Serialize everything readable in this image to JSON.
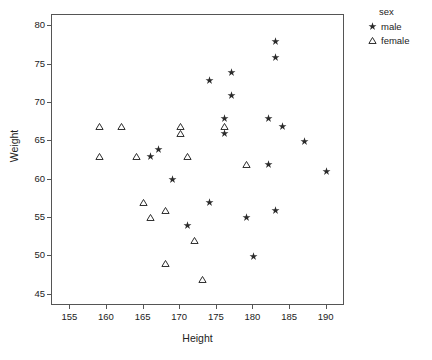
{
  "chart_data": {
    "type": "scatter",
    "title": "",
    "xlabel": "Height",
    "ylabel": "Weight",
    "xlim": [
      152.5,
      192.5
    ],
    "ylim": [
      43.5,
      81.5
    ],
    "xticks": [
      155,
      160,
      165,
      170,
      175,
      180,
      185,
      190
    ],
    "yticks": [
      45,
      50,
      55,
      60,
      65,
      70,
      75,
      80
    ],
    "grid": false,
    "legend": {
      "title": "sex",
      "position": "right-top",
      "entries": [
        {
          "label": "male",
          "marker": "star"
        },
        {
          "label": "female",
          "marker": "triangle"
        }
      ]
    },
    "series": [
      {
        "name": "male",
        "marker": "star",
        "color": "#2b2b2b",
        "points": [
          {
            "x": 166,
            "y": 63
          },
          {
            "x": 167,
            "y": 64
          },
          {
            "x": 169,
            "y": 60
          },
          {
            "x": 171,
            "y": 54
          },
          {
            "x": 174,
            "y": 73
          },
          {
            "x": 174,
            "y": 57
          },
          {
            "x": 176,
            "y": 68
          },
          {
            "x": 176,
            "y": 66
          },
          {
            "x": 177,
            "y": 74
          },
          {
            "x": 177,
            "y": 71
          },
          {
            "x": 179,
            "y": 55
          },
          {
            "x": 180,
            "y": 50
          },
          {
            "x": 182,
            "y": 68
          },
          {
            "x": 182,
            "y": 62
          },
          {
            "x": 183,
            "y": 78
          },
          {
            "x": 183,
            "y": 76
          },
          {
            "x": 183,
            "y": 56
          },
          {
            "x": 184,
            "y": 67
          },
          {
            "x": 187,
            "y": 65
          },
          {
            "x": 190,
            "y": 61
          }
        ]
      },
      {
        "name": "female",
        "marker": "triangle",
        "color": "#2b2b2b",
        "points": [
          {
            "x": 159,
            "y": 67
          },
          {
            "x": 162,
            "y": 67
          },
          {
            "x": 159,
            "y": 63
          },
          {
            "x": 164,
            "y": 63
          },
          {
            "x": 170,
            "y": 67
          },
          {
            "x": 170,
            "y": 66
          },
          {
            "x": 171,
            "y": 63
          },
          {
            "x": 165,
            "y": 57
          },
          {
            "x": 168,
            "y": 56
          },
          {
            "x": 166,
            "y": 55
          },
          {
            "x": 172,
            "y": 52
          },
          {
            "x": 168,
            "y": 49
          },
          {
            "x": 173,
            "y": 47
          },
          {
            "x": 176,
            "y": 67
          },
          {
            "x": 179,
            "y": 62
          }
        ]
      }
    ]
  }
}
